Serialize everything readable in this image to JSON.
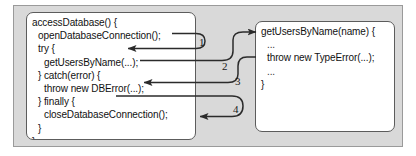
{
  "figure": {
    "background_color": "#d9d9d9",
    "box_fill_color": "#ffffff",
    "stroke_color": "#333333"
  },
  "left_box": {
    "name": "accessDatabase",
    "lines": [
      {
        "indent": 0,
        "text": "accessDatabase() {"
      },
      {
        "indent": 1,
        "text": "openDatabaseConnection();"
      },
      {
        "indent": 1,
        "text": "try {"
      },
      {
        "indent": 2,
        "text": "getUsersByName(...);"
      },
      {
        "indent": 1,
        "text": "} catch(error) {"
      },
      {
        "indent": 2,
        "text": "throw new DBError(...);"
      },
      {
        "indent": 1,
        "text": "} finally {"
      },
      {
        "indent": 2,
        "text": "closeDatabaseConnection();"
      },
      {
        "indent": 1,
        "text": "}"
      },
      {
        "indent": 0,
        "text": "}"
      }
    ]
  },
  "right_box": {
    "name": "getUsersByName",
    "lines": [
      {
        "indent": 0,
        "text": "getUsersByName(name) {"
      },
      {
        "indent": 1,
        "text": "..."
      },
      {
        "indent": 1,
        "text": "throw new TypeError(...);"
      },
      {
        "indent": 1,
        "text": "..."
      },
      {
        "indent": 0,
        "text": "}"
      }
    ]
  },
  "arrows": [
    {
      "id": "1",
      "label": "1",
      "from": "openDatabaseConnection();",
      "to": "try {"
    },
    {
      "id": "2",
      "label": "2",
      "from": "getUsersByName(...);",
      "to": "getUsersByName(name) {"
    },
    {
      "id": "3",
      "label": "3",
      "from": "throw new TypeError(...);",
      "to": "throw new DBError(...);"
    },
    {
      "id": "4",
      "label": "4",
      "from": "} finally {",
      "to": "closeDatabaseConnection();"
    }
  ]
}
